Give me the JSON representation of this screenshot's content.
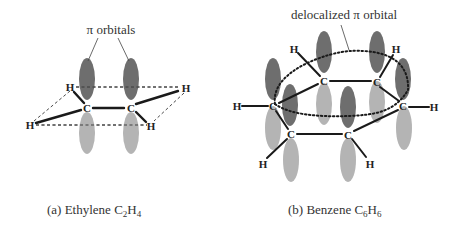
{
  "colors": {
    "orbital_dark": "#6e6e6e",
    "orbital_light": "#b4b4b4",
    "bond": "#1a1a1a",
    "text": "#333333"
  },
  "ethylene": {
    "annotation": "π orbitals",
    "caption_prefix": "(a) Ethylene C",
    "caption_sub1": "2",
    "caption_mid": "H",
    "caption_sub2": "4",
    "atoms": {
      "c1": "C",
      "c2": "C",
      "h1": "H",
      "h2": "H",
      "h3": "H",
      "h4": "H"
    }
  },
  "benzene": {
    "annotation": "delocalized π orbital",
    "caption_prefix": "(b) Benzene C",
    "caption_sub1": "6",
    "caption_mid": "H",
    "caption_sub2": "6",
    "atoms": {
      "c1": "C",
      "c2": "C",
      "c3": "C",
      "c4": "C",
      "c5": "C",
      "c6": "C",
      "h1": "H",
      "h2": "H",
      "h3": "H",
      "h4": "H",
      "h5": "H",
      "h6": "H"
    }
  }
}
